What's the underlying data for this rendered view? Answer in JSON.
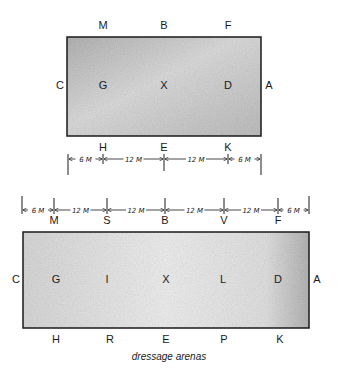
{
  "caption": "dressage arenas",
  "colors": {
    "ink": "#1a1a1a",
    "fill_dark": "#b8b8b8",
    "fill_light": "#e4e4e4"
  },
  "small_arena": {
    "size": "20m x 40m",
    "rect": {
      "x": 67,
      "y": 37,
      "w": 194,
      "h": 99
    },
    "top_letters": [
      {
        "t": "M",
        "x": 103
      },
      {
        "t": "B",
        "x": 164
      },
      {
        "t": "F",
        "x": 228
      }
    ],
    "bottom_letters": [
      {
        "t": "H",
        "x": 103
      },
      {
        "t": "E",
        "x": 164
      },
      {
        "t": "K",
        "x": 228
      }
    ],
    "left_letter": "C",
    "right_letter": "A",
    "centerline_letters": [
      {
        "t": "G",
        "x": 103
      },
      {
        "t": "X",
        "x": 164
      },
      {
        "t": "D",
        "x": 228
      }
    ],
    "dimensions": {
      "y": 159,
      "ticks": [
        68,
        103,
        164,
        228,
        261
      ],
      "segments": [
        "6 M",
        "12 M",
        "12 M",
        "6 M"
      ]
    }
  },
  "large_arena": {
    "size": "20m x 60m",
    "rect": {
      "x": 23,
      "y": 232,
      "w": 286,
      "h": 96
    },
    "top_letters": [
      {
        "t": "M",
        "x": 54
      },
      {
        "t": "S",
        "x": 107
      },
      {
        "t": "B",
        "x": 165
      },
      {
        "t": "V",
        "x": 224
      },
      {
        "t": "F",
        "x": 278
      }
    ],
    "bottom_letters": [
      {
        "t": "H",
        "x": 56
      },
      {
        "t": "R",
        "x": 110
      },
      {
        "t": "E",
        "x": 166
      },
      {
        "t": "P",
        "x": 224
      },
      {
        "t": "K",
        "x": 280
      }
    ],
    "left_letter": "C",
    "right_letter": "A",
    "centerline_letters": [
      {
        "t": "G",
        "x": 56
      },
      {
        "t": "I",
        "x": 107
      },
      {
        "t": "X",
        "x": 166
      },
      {
        "t": "L",
        "x": 223
      },
      {
        "t": "D",
        "x": 278
      }
    ],
    "dimensions": {
      "y": 210,
      "ticks": [
        22,
        54,
        107,
        165,
        224,
        278,
        309
      ],
      "segments": [
        "6 M",
        "12 M",
        "12 M",
        "12 M",
        "12 M",
        "6 M"
      ]
    }
  }
}
